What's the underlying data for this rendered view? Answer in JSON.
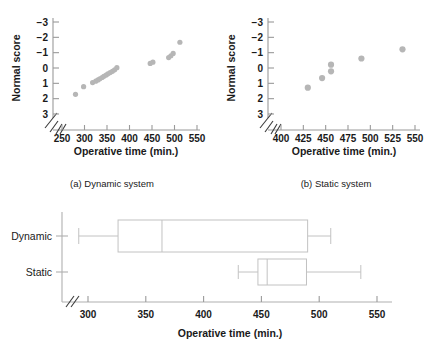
{
  "figure": {
    "label": "normal-probability-and-boxplot-figure",
    "point_color": "#b6b6b6",
    "axis_color": "#9a9a9a",
    "box_color": "#c2c2c2"
  },
  "panel_a": {
    "caption": "(a) Dynamic system",
    "xlabel": "Operative time (min.)",
    "ylabel": "Normal score",
    "xticks": [
      "250",
      "300",
      "350",
      "400",
      "450",
      "500",
      "550"
    ],
    "yticks": [
      "3",
      "2",
      "1",
      "0",
      "−1",
      "−2",
      "−3"
    ]
  },
  "panel_b": {
    "caption": "(b) Static system",
    "xlabel": "Operative time (min.)",
    "ylabel": "Normal score",
    "xticks": [
      "400",
      "425",
      "450",
      "475",
      "500",
      "525",
      "550"
    ],
    "yticks": [
      "3",
      "2",
      "1",
      "0",
      "−1",
      "−2",
      "−3"
    ]
  },
  "panel_c": {
    "xlabel": "Operative time (min.)",
    "xticks": [
      "300",
      "350",
      "400",
      "450",
      "500",
      "550"
    ],
    "categories": [
      "Dynamic",
      "Static"
    ]
  },
  "chart_data": [
    {
      "type": "scatter",
      "title": "(a) Dynamic system",
      "xlabel": "Operative time (min.)",
      "ylabel": "Normal score",
      "xlim": [
        240,
        565
      ],
      "ylim": [
        -3.5,
        3.5
      ],
      "xticks": [
        250,
        300,
        350,
        400,
        450,
        500,
        550
      ],
      "yticks": [
        -3,
        -2,
        -1,
        0,
        1,
        2,
        3
      ],
      "axis_break_x": true,
      "grid": false,
      "legend": "none",
      "x": [
        280,
        298,
        318,
        325,
        330,
        334,
        339,
        343,
        348,
        352,
        357,
        362,
        367,
        372,
        446,
        452,
        487,
        492,
        497,
        512
      ],
      "y": [
        -1.72,
        -1.22,
        -0.95,
        -0.86,
        -0.78,
        -0.7,
        -0.62,
        -0.54,
        -0.46,
        -0.38,
        -0.3,
        -0.22,
        -0.12,
        0.02,
        0.3,
        0.38,
        0.68,
        0.8,
        0.95,
        1.68
      ]
    },
    {
      "type": "scatter",
      "title": "(b) Static system",
      "xlabel": "Operative time (min.)",
      "ylabel": "Normal score",
      "xlim": [
        392,
        568
      ],
      "ylim": [
        -3.5,
        3.5
      ],
      "xticks": [
        400,
        425,
        450,
        475,
        500,
        525,
        550
      ],
      "yticks": [
        -3,
        -2,
        -1,
        0,
        1,
        2,
        3
      ],
      "axis_break_x": true,
      "grid": false,
      "legend": "none",
      "x": [
        430,
        446,
        456,
        456,
        490,
        536
      ],
      "y": [
        -1.28,
        -0.66,
        0.22,
        -0.22,
        0.62,
        1.22
      ]
    },
    {
      "type": "boxplot",
      "title": "",
      "xlabel": "Operative time (min.)",
      "ylabel": "",
      "xlim": [
        282,
        568
      ],
      "xticks": [
        300,
        350,
        400,
        450,
        500,
        550
      ],
      "axis_break_x": true,
      "grid": false,
      "legend": "none",
      "categories": [
        "Dynamic",
        "Static"
      ],
      "boxes": [
        {
          "name": "Dynamic",
          "min": 292,
          "q1": 326,
          "median": 364,
          "q3": 490,
          "max": 510
        },
        {
          "name": "Static",
          "min": 430,
          "q1": 447,
          "median": 455,
          "q3": 489,
          "max": 536
        }
      ]
    }
  ]
}
